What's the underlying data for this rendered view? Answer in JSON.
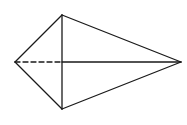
{
  "diagram": {
    "type": "geometric-solid",
    "background": "#ffffff",
    "stroke_color": "#1a1a1a",
    "vertices": {
      "left": {
        "x": 15,
        "y": 62
      },
      "top": {
        "x": 62,
        "y": 15
      },
      "bottom": {
        "x": 62,
        "y": 109
      },
      "right": {
        "x": 181,
        "y": 62
      },
      "center": {
        "x": 62,
        "y": 62
      }
    },
    "edges": [
      {
        "name": "left-top",
        "from": "left",
        "to": "top",
        "style": "solid"
      },
      {
        "name": "left-bottom",
        "from": "left",
        "to": "bottom",
        "style": "solid"
      },
      {
        "name": "top-right",
        "from": "top",
        "to": "right",
        "style": "solid"
      },
      {
        "name": "bottom-right",
        "from": "bottom",
        "to": "right",
        "style": "solid"
      },
      {
        "name": "top-bottom",
        "from": "top",
        "to": "bottom",
        "style": "solid"
      },
      {
        "name": "center-right",
        "from": "center",
        "to": "right",
        "style": "solid"
      },
      {
        "name": "left-center",
        "from": "left",
        "to": "center",
        "style": "dashed"
      }
    ]
  }
}
